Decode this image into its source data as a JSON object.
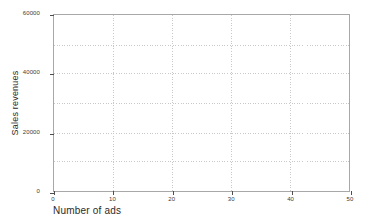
{
  "chart_data": {
    "type": "scatter",
    "title": "",
    "subtitle": "",
    "xlabel": "Number of ads",
    "ylabel": "Sales revenues",
    "xlim": [
      0,
      50
    ],
    "ylim": [
      0,
      60000
    ],
    "x_ticks": [
      0,
      10,
      20,
      30,
      40,
      50
    ],
    "x_tick_labels": [
      "0",
      "10",
      "20",
      "30",
      "40",
      "50"
    ],
    "y_ticks": [
      0,
      20000,
      40000,
      60000
    ],
    "y_tick_labels": [
      "0",
      "20000",
      "40000",
      "60000"
    ],
    "y_gridlines": [
      0,
      10000,
      20000,
      30000,
      40000,
      50000,
      60000
    ],
    "x_gridlines": [
      0,
      10,
      20,
      30,
      40,
      50
    ],
    "grid": true,
    "grid_style": "dotted",
    "legend": null,
    "series": [
      {
        "name": "",
        "x": [],
        "y": []
      }
    ],
    "annotations": [],
    "note": "Empty plot area: axes and gridlines drawn, no data points or lines rendered."
  },
  "colors": {
    "background": "#ffffff",
    "frame": "#a8a8a8",
    "gridline": "#c8c8c8",
    "tick_mark": "#4d4d4d",
    "tick_label": "#3a3a3a",
    "axis_title": "#2b2b2b"
  }
}
